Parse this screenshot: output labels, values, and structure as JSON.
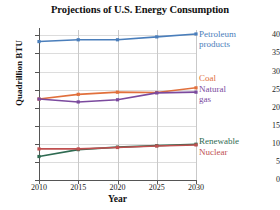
{
  "chart_data": {
    "type": "line",
    "title": "Projections of U.S. Energy Consumption",
    "xlabel": "Year",
    "ylabel": "Quadrillion BTU",
    "x": [
      2010,
      2015,
      2020,
      2025,
      2030
    ],
    "xticklabels": [
      "2010",
      "2015",
      "2020",
      "2025",
      "2030"
    ],
    "yticklabels": [
      "0",
      "5",
      "10",
      "15",
      "20",
      "25",
      "30",
      "35",
      "40"
    ],
    "yticks": [
      0,
      5,
      10,
      15,
      20,
      25,
      30,
      35,
      40
    ],
    "xlim": [
      2010,
      2030
    ],
    "ylim": [
      0,
      41.5
    ],
    "grid": true,
    "legend_position": "right-inline",
    "markers": "square",
    "series": [
      {
        "name": "Petroleum products",
        "label_lines": [
          "Petroleum",
          "products"
        ],
        "color": "#4a7ebb",
        "values": [
          38.3,
          38.8,
          38.8,
          39.6,
          40.4
        ]
      },
      {
        "name": "Coal",
        "label_lines": [
          "Coal"
        ],
        "color": "#e1703c",
        "values": [
          22.4,
          23.7,
          24.3,
          24.2,
          25.5
        ]
      },
      {
        "name": "Natural gas",
        "label_lines": [
          "Natural",
          "gas"
        ],
        "color": "#7b4a9e",
        "values": [
          22.4,
          21.6,
          22.2,
          24.1,
          24.3
        ]
      },
      {
        "name": "Renewable",
        "label_lines": [
          "Renewable"
        ],
        "color": "#2f6b52",
        "values": [
          6.5,
          8.4,
          9.1,
          9.5,
          9.9
        ]
      },
      {
        "name": "Nuclear",
        "label_lines": [
          "Nuclear"
        ],
        "color": "#c05050",
        "values": [
          8.6,
          8.6,
          9.0,
          9.4,
          9.7
        ]
      }
    ]
  }
}
